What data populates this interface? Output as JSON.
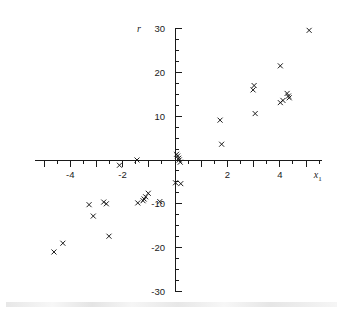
{
  "figure": {
    "background_color": "#ffffff",
    "ink_color": "#1a1a1a"
  },
  "chart_data": {
    "type": "scatter",
    "title": "",
    "xlabel": "x1",
    "xlabel_base": "x",
    "xlabel_sub": "1",
    "ylabel": "r",
    "xlim": [
      -5.35,
      5.6
    ],
    "ylim": [
      -30,
      30
    ],
    "grid": false,
    "legend": "none",
    "marker": "x",
    "marker_color": "#111111",
    "x_ticks_major": [
      -4,
      -2,
      2,
      4
    ],
    "x_tick_labels": [
      "-4",
      "-2",
      "2",
      "4"
    ],
    "x_tick_minor_step": 0.5,
    "y_ticks_major": [
      30,
      20,
      10,
      -10,
      -20,
      -30
    ],
    "y_tick_labels": [
      "30",
      "20",
      "10",
      "-10",
      "-20",
      "-30"
    ],
    "y_tick_minor_step": 2.5,
    "x_axis_position_y": 0,
    "y_axis_position_x": 0,
    "points": [
      {
        "x": 5.12,
        "y": 29.6
      },
      {
        "x": 4.02,
        "y": 21.5
      },
      {
        "x": 3.02,
        "y": 17.0
      },
      {
        "x": 2.98,
        "y": 16.0
      },
      {
        "x": 4.28,
        "y": 15.2
      },
      {
        "x": 4.33,
        "y": 14.6
      },
      {
        "x": 4.36,
        "y": 14.2
      },
      {
        "x": 4.12,
        "y": 13.6
      },
      {
        "x": 4.02,
        "y": 13.1
      },
      {
        "x": 3.06,
        "y": 10.6
      },
      {
        "x": 1.72,
        "y": 9.1
      },
      {
        "x": 1.78,
        "y": 3.6
      },
      {
        "x": 0.06,
        "y": 1.3
      },
      {
        "x": 0.1,
        "y": 0.9
      },
      {
        "x": 0.14,
        "y": 0.4
      },
      {
        "x": 0.16,
        "y": 0.0
      },
      {
        "x": 0.2,
        "y": -0.5
      },
      {
        "x": -1.45,
        "y": 0.0
      },
      {
        "x": -2.12,
        "y": -1.2
      },
      {
        "x": 0.02,
        "y": -5.2
      },
      {
        "x": 0.22,
        "y": -5.4
      },
      {
        "x": -1.02,
        "y": -7.6
      },
      {
        "x": -1.12,
        "y": -8.4
      },
      {
        "x": -1.18,
        "y": -8.9
      },
      {
        "x": -1.22,
        "y": -9.3
      },
      {
        "x": -0.58,
        "y": -9.5
      },
      {
        "x": -1.42,
        "y": -9.8
      },
      {
        "x": -2.72,
        "y": -9.6
      },
      {
        "x": -2.62,
        "y": -10.0
      },
      {
        "x": -3.28,
        "y": -10.2
      },
      {
        "x": -3.12,
        "y": -12.8
      },
      {
        "x": -2.52,
        "y": -17.4
      },
      {
        "x": -4.28,
        "y": -19.0
      },
      {
        "x": -4.62,
        "y": -21.0
      }
    ]
  }
}
